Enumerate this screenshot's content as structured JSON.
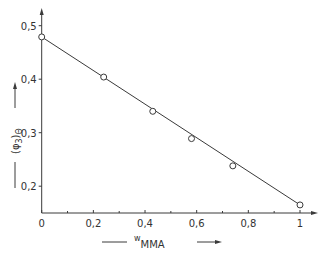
{
  "chart_data": {
    "type": "scatter",
    "title": "",
    "xlabel": "w_MMA",
    "xlabel_main": "w",
    "xlabel_sub": "MMA",
    "ylabel": "(φ3)Θ",
    "ylabel_main": "(φ",
    "ylabel_sub": "3",
    "ylabel_close": ")",
    "ylabel_sub2": "Θ",
    "xlim": [
      0,
      1.0
    ],
    "ylim": [
      0.15,
      0.52
    ],
    "grid": false,
    "legend": null,
    "x_ticks": [
      "0",
      "0,2",
      "0,4",
      "0,6",
      "0,8",
      "1"
    ],
    "x_tick_values": [
      0,
      0.2,
      0.4,
      0.6,
      0.8,
      1.0
    ],
    "x_minor_ticks": [
      0.1,
      0.3,
      0.5,
      0.7,
      0.9
    ],
    "y_ticks": [
      "0,2",
      "0,3",
      "0,4",
      "0,5"
    ],
    "y_tick_values": [
      0.2,
      0.3,
      0.4,
      0.5
    ],
    "series": [
      {
        "name": "measured",
        "marker": "open-circle",
        "x": [
          0.0,
          0.24,
          0.43,
          0.58,
          0.74,
          1.0
        ],
        "y": [
          0.479,
          0.404,
          0.34,
          0.289,
          0.238,
          0.165
        ]
      },
      {
        "name": "linear fit",
        "style": "line",
        "x": [
          0.0,
          1.0
        ],
        "y": [
          0.479,
          0.165
        ]
      }
    ]
  }
}
